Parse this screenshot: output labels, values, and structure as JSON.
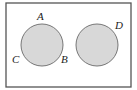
{
  "diagram": {
    "type": "venn",
    "colors": {
      "border": "#555555",
      "circle_fill": "#d8d8d8",
      "circle_stroke": "#777777",
      "background": "#ffffff"
    },
    "frame": {
      "x": 6,
      "y": 3,
      "width": 125,
      "height": 84
    },
    "circles": [
      {
        "id": "left",
        "cx": 42,
        "cy": 45,
        "r": 21
      },
      {
        "id": "right",
        "cx": 97,
        "cy": 45,
        "r": 21
      }
    ],
    "labels": [
      {
        "text": "A",
        "x": 37,
        "y": 20
      },
      {
        "text": "B",
        "x": 61,
        "y": 63
      },
      {
        "text": "C",
        "x": 12,
        "y": 63
      },
      {
        "text": "D",
        "x": 115,
        "y": 29
      }
    ]
  }
}
